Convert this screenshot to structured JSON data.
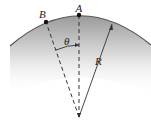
{
  "diagram": {
    "labels": {
      "point_a": "A",
      "point_b": "B",
      "angle": "θ",
      "radius": "R"
    },
    "colors": {
      "arc": "#555555",
      "lines": "#333333",
      "shade_top": "#9a9a9a",
      "shade_bottom": "#ffffff"
    }
  }
}
